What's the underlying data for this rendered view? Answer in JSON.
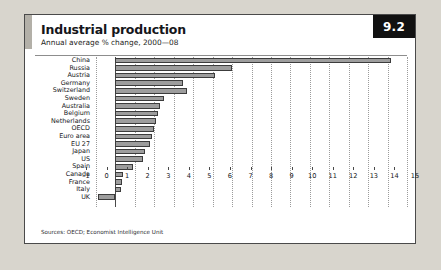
{
  "figure": {
    "badge": "9.2",
    "title": "Industrial production",
    "subtitle": "Annual average % change, 2000—08",
    "source": "Sources: OECD; Economist Intelligence Unit"
  },
  "colors": {
    "bar_fill": "#9d9d9d",
    "bar_stroke": "#3c3c3c",
    "badge_bg": "#111111",
    "badge_text": "#ffffff",
    "frame": "#4a4a4a",
    "grid": "#9b9b9b",
    "page_bg": "#d8d5cd",
    "accent": "#b3b0a8"
  },
  "chart_data": {
    "type": "bar",
    "orientation": "horizontal",
    "title": "Industrial production",
    "subtitle": "Annual average % change, 2000—08",
    "xlabel": "",
    "ylabel": "",
    "xlim": [
      -1,
      15
    ],
    "xticks": [
      -1,
      0,
      1,
      2,
      3,
      4,
      5,
      6,
      7,
      8,
      9,
      10,
      11,
      12,
      13,
      14,
      15
    ],
    "xtick_labels": [
      "–1",
      "0",
      "1",
      "2",
      "3",
      "4",
      "5",
      "6",
      "7",
      "8",
      "9",
      "10",
      "11",
      "12",
      "13",
      "14",
      "15"
    ],
    "grid": true,
    "legend": false,
    "categories": [
      "China",
      "Russia",
      "Austria",
      "Germany",
      "Switzerland",
      "Sweden",
      "Australia",
      "Belgium",
      "Netherlands",
      "OECD",
      "Euro area",
      "EU 27",
      "Japan",
      "US",
      "Spain",
      "Canada",
      "France",
      "Italy",
      "UK"
    ],
    "values": [
      14.2,
      6.0,
      5.1,
      3.5,
      3.7,
      2.5,
      2.3,
      2.2,
      2.1,
      2.0,
      1.9,
      1.8,
      1.5,
      1.4,
      0.9,
      0.4,
      0.35,
      0.3,
      -0.9
    ]
  }
}
